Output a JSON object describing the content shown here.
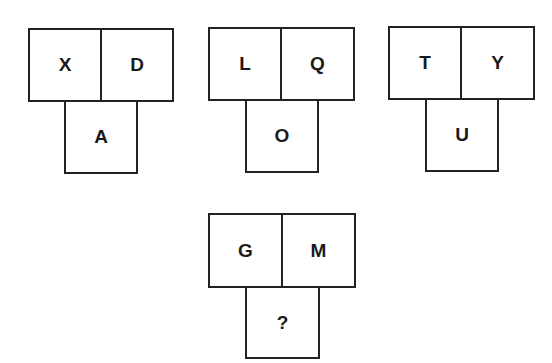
{
  "puzzle": {
    "groups": [
      {
        "top_left": "X",
        "top_right": "D",
        "bottom": "A"
      },
      {
        "top_left": "L",
        "top_right": "Q",
        "bottom": "O"
      },
      {
        "top_left": "T",
        "top_right": "Y",
        "bottom": "U"
      },
      {
        "top_left": "G",
        "top_right": "M",
        "bottom": "?"
      }
    ]
  }
}
